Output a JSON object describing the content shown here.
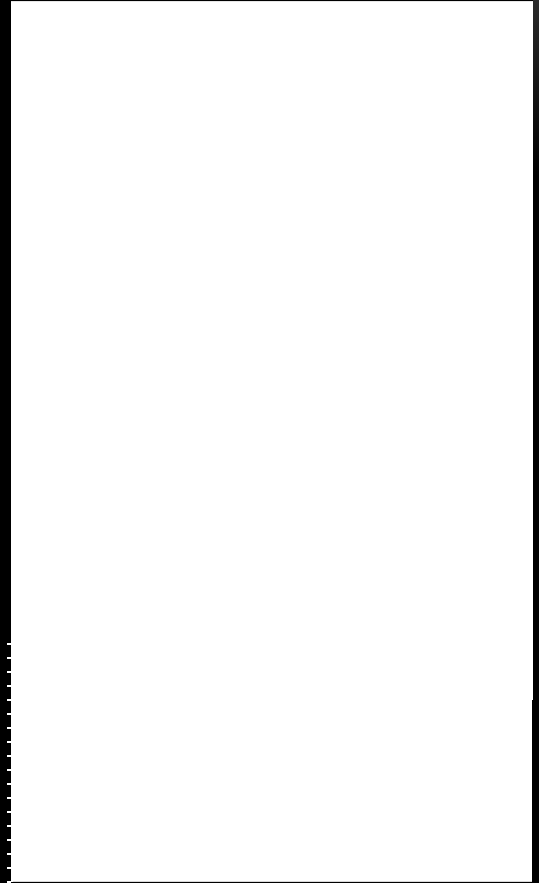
{
  "document": {
    "type": "scanned-page",
    "content": "",
    "is_blank": true
  },
  "colors": {
    "page": "#ffffff",
    "margin": "#000000"
  }
}
